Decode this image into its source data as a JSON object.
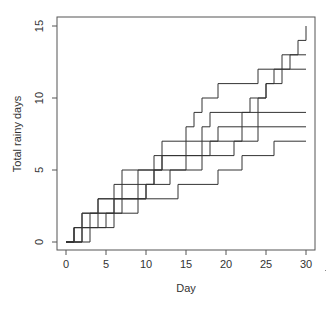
{
  "chart_data": {
    "type": "line",
    "subtype": "step",
    "title": "",
    "xlabel": "Day",
    "ylabel": "Total rainy days",
    "xlim": [
      0,
      30
    ],
    "ylim": [
      0,
      15
    ],
    "xticks": [
      0,
      5,
      10,
      15,
      20,
      25,
      30
    ],
    "yticks": [
      0,
      5,
      10,
      15
    ],
    "grid": false,
    "legend": null,
    "x": [
      0,
      1,
      2,
      3,
      4,
      5,
      6,
      7,
      8,
      9,
      10,
      11,
      12,
      13,
      14,
      15,
      16,
      17,
      18,
      19,
      20,
      21,
      22,
      23,
      24,
      25,
      26,
      27,
      28,
      29,
      30
    ],
    "series": [
      {
        "name": "sim1",
        "values": [
          0,
          1,
          2,
          2,
          3,
          3,
          4,
          5,
          5,
          5,
          5,
          6,
          7,
          7,
          7,
          8,
          9,
          10,
          10,
          11,
          11,
          11,
          11,
          11,
          12,
          12,
          12,
          13,
          13,
          14,
          15
        ]
      },
      {
        "name": "sim2",
        "values": [
          0,
          1,
          1,
          2,
          3,
          3,
          3,
          4,
          4,
          5,
          5,
          5,
          6,
          6,
          6,
          7,
          7,
          8,
          9,
          9,
          9,
          9,
          9,
          10,
          10,
          11,
          12,
          12,
          13,
          13,
          13
        ]
      },
      {
        "name": "sim3",
        "values": [
          0,
          1,
          2,
          2,
          2,
          2,
          3,
          3,
          3,
          3,
          4,
          5,
          6,
          6,
          6,
          6,
          6,
          7,
          7,
          8,
          8,
          8,
          9,
          9,
          10,
          11,
          11,
          12,
          12,
          12,
          12
        ]
      },
      {
        "name": "sim4",
        "values": [
          0,
          0,
          1,
          1,
          1,
          2,
          2,
          3,
          3,
          4,
          4,
          5,
          5,
          5,
          5,
          6,
          6,
          6,
          7,
          7,
          7,
          7,
          8,
          8,
          9,
          9,
          9,
          9,
          9,
          9,
          9
        ]
      },
      {
        "name": "sim5",
        "values": [
          0,
          0,
          1,
          1,
          2,
          2,
          3,
          3,
          3,
          3,
          4,
          4,
          4,
          5,
          5,
          5,
          5,
          6,
          6,
          6,
          6,
          7,
          7,
          7,
          8,
          8,
          8,
          8,
          8,
          8,
          8
        ]
      },
      {
        "name": "sim6",
        "values": [
          0,
          0,
          0,
          1,
          1,
          1,
          2,
          2,
          2,
          3,
          3,
          3,
          3,
          3,
          4,
          4,
          4,
          4,
          4,
          5,
          5,
          5,
          6,
          6,
          6,
          6,
          7,
          7,
          7,
          7,
          7
        ]
      }
    ]
  },
  "axes": {
    "x_title": "Day",
    "y_title": "Total rainy days",
    "x_tick_labels": [
      "0",
      "5",
      "10",
      "15",
      "20",
      "25",
      "30"
    ],
    "y_tick_labels": [
      "0",
      "5",
      "10",
      "15"
    ]
  },
  "colors": {
    "line": "#333333",
    "frame": "#555555",
    "background": "#ffffff"
  }
}
